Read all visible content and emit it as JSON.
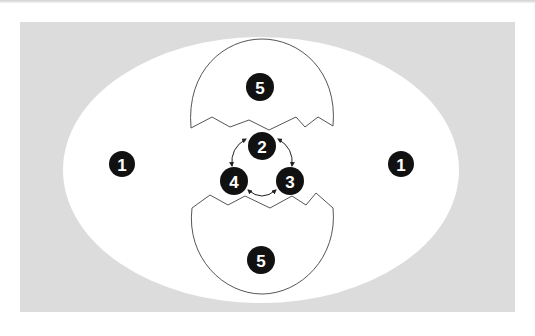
{
  "colors": {
    "background": "#ffffff",
    "panel": "#dcdcdc",
    "ellipse": "#ffffff",
    "shell_stroke": "#555555",
    "marker_fill": "#111111",
    "marker_text": "#ffffff",
    "arrow": "#222222"
  },
  "markers": {
    "left": "1",
    "right": "1",
    "top_shell": "5",
    "bottom_shell": "5",
    "cycle_top": "2",
    "cycle_right": "3",
    "cycle_left": "4"
  }
}
